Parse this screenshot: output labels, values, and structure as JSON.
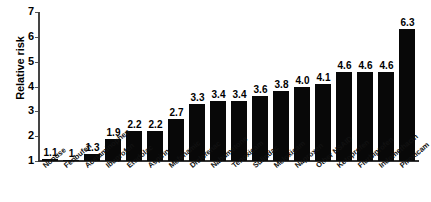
{
  "chart_data": {
    "type": "bar",
    "title": "",
    "subtitle": "",
    "xlabel": "",
    "ylabel": "Relative risk",
    "ylim": [
      1,
      7
    ],
    "yticks": [
      1,
      2,
      3,
      4,
      5,
      6,
      7
    ],
    "grid": false,
    "legend": null,
    "orientation": "vertical",
    "bar_color": "#080808",
    "categories": [
      "Nonuse",
      "Fenbufen",
      "Acetaminophen",
      "Ibuprofen",
      "Etodolac",
      "Aspirin",
      "Mefenamic",
      "Diclofenac",
      "Nabumetone",
      "Tenoxicam",
      "Sulindac",
      "Meloxicam",
      "Naproxen",
      "Other NSAID",
      "Ketoprofen",
      "Flurbiprofen",
      "Indomethacin",
      "Piroxicam"
    ],
    "values": [
      1.1,
      1,
      1.3,
      1.9,
      2.2,
      2.2,
      2.7,
      3.3,
      3.4,
      3.4,
      3.6,
      3.8,
      4.0,
      4.1,
      4.6,
      4.6,
      4.6,
      6.3
    ],
    "value_labels": [
      "1.1",
      "1",
      "1.3",
      "1.9",
      "2.2",
      "2.2",
      "2.7",
      "3.3",
      "3.4",
      "3.4",
      "3.6",
      "3.8",
      "4.0",
      "4.1",
      "4.6",
      "4.6",
      "4.6",
      "6.3"
    ]
  }
}
